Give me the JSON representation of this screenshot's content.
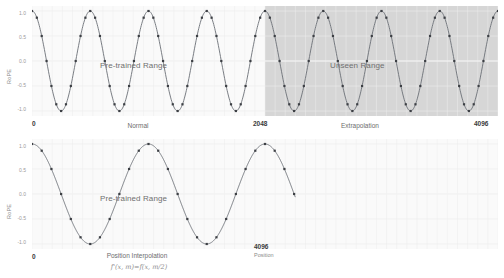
{
  "figure": {
    "title": "",
    "panels": [
      {
        "id": "normal-extrapolation",
        "ylabel": "RoPE",
        "yticks": [
          "1.0",
          "0.5",
          "0.0",
          "-0.5",
          "-1.0"
        ],
        "xticks": [
          "0",
          "2048",
          "4096"
        ],
        "caption_left": "Normal",
        "caption_right": "Extrapolation",
        "annotation_pretrained": "Pre-trained Range",
        "annotation_unseen": "Unseen Range",
        "shaded_label": "Unseen Range"
      },
      {
        "id": "position-interpolation",
        "ylabel": "RoPE",
        "yticks": [
          "1.0",
          "0.5",
          "0.0",
          "-0.5",
          "-1.0"
        ],
        "xticks": [
          "0",
          "4096"
        ],
        "caption": "Position Interpolation",
        "formula": "f'(x, m)=f(x, m/2)",
        "annotation_pretrained": "Pre-trained Range",
        "xaxis_title": "Position"
      }
    ]
  },
  "colors": {
    "line": "#6b6f76",
    "marker": "#3c3f44",
    "shade": "#d6d6d6",
    "grid": "#ededed",
    "background": "#fafafa",
    "tick_text": "#9a9a9a",
    "bold_text": "#3a3a3a"
  },
  "chart_data": [
    {
      "type": "line",
      "id": "normal-extrapolation",
      "title": "",
      "xlabel": "",
      "ylabel": "RoPE",
      "xlim": [
        0,
        4096
      ],
      "ylim": [
        -1.1,
        1.1
      ],
      "grid": true,
      "legend": "none",
      "xtick_values": [
        0,
        2048,
        4096
      ],
      "xtick_labels": [
        "0",
        "2048",
        "4096"
      ],
      "ytick_values": [
        1.0,
        0.5,
        0.0,
        -0.5,
        -1.0
      ],
      "ytick_labels": [
        "1.0",
        "0.5",
        "0.0",
        "-0.5",
        "-1.0"
      ],
      "periods": 8,
      "markers_per_period": 12,
      "series": [
        {
          "name": "RoPE cos(2π·8·x/4096)",
          "function": "cos",
          "amplitude": 1.0,
          "cycles_over_range": 8,
          "phase": 0
        }
      ],
      "annotations": [
        {
          "text": "Pre-trained Range",
          "x": 1024,
          "y": 0.0
        },
        {
          "text": "Unseen Range",
          "x": 3072,
          "y": 0.0
        },
        {
          "text": "Normal",
          "x": 1024,
          "y": -1.35
        },
        {
          "text": "Extrapolation",
          "x": 3072,
          "y": -1.35
        }
      ],
      "shaded_regions": [
        {
          "label": "Unseen Range",
          "x_start": 2048,
          "x_end": 4096,
          "color": "#d6d6d6"
        }
      ]
    },
    {
      "type": "line",
      "id": "position-interpolation",
      "title": "",
      "xlabel": "Position",
      "ylabel": "RoPE",
      "xlim": [
        0,
        4096
      ],
      "ylim": [
        -1.1,
        1.1
      ],
      "grid": true,
      "legend": "none",
      "xtick_values": [
        0,
        4096
      ],
      "xtick_labels": [
        "0",
        "4096"
      ],
      "ytick_values": [
        1.0,
        0.5,
        0.0,
        -0.5,
        -1.0
      ],
      "ytick_labels": [
        "1.0",
        "0.5",
        "0.0",
        "-0.5",
        "-1.0"
      ],
      "periods": 4,
      "markers_per_period": 12,
      "series": [
        {
          "name": "RoPE cos(2π·4·x/4096)",
          "function": "cos",
          "amplitude": 1.0,
          "cycles_over_range": 4,
          "phase": 0
        }
      ],
      "annotations": [
        {
          "text": "Pre-trained Range",
          "x": 1024,
          "y": 0.0
        },
        {
          "text": "Position Interpolation",
          "x": 1200,
          "y": -1.35
        },
        {
          "text": "f'(x, m)=f(x, m/2)",
          "x": 1200,
          "y": -1.6
        }
      ],
      "shaded_regions": []
    }
  ]
}
